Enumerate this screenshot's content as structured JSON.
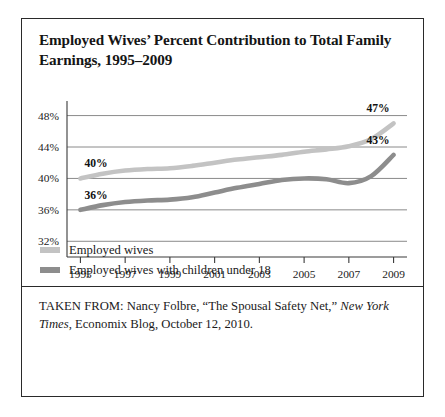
{
  "figure": {
    "title": "Employed Wives’ Percent Contribution to Total Family Earnings, 1995–2009",
    "source_prefix": "TAKEN FROM: Nancy Folbre, “The Spousal Safety Net,” ",
    "source_italic": "New York Times",
    "source_suffix": ", Economix Blog, October 12, 2010."
  },
  "colors": {
    "series_light": "#c3c3c3",
    "series_dark": "#8d8d8d",
    "axis": "#3a3a3a",
    "gridline": "#7d7d7d",
    "border": "#2a2a2a",
    "text": "#1a1a1a"
  },
  "chart_data": {
    "type": "line",
    "title": "Employed Wives’ Percent Contribution to Total Family Earnings, 1995–2009",
    "xlabel": "",
    "ylabel": "",
    "xlim": [
      1994.4,
      2009.6
    ],
    "ylim": [
      30.0,
      49.6
    ],
    "xticks": [
      1995,
      1996,
      1997,
      1998,
      1999,
      2000,
      2001,
      2002,
      2003,
      2004,
      2005,
      2006,
      2007,
      2008,
      2009
    ],
    "xtick_labels": [
      "1995",
      "",
      "1997",
      "",
      "1999",
      "",
      "2001",
      "",
      "2003",
      "",
      "2005",
      "",
      "2007",
      "",
      "2009"
    ],
    "yticks": [
      32,
      36,
      40,
      44,
      48
    ],
    "ytick_labels": [
      "32%",
      "36%",
      "40%",
      "44%",
      "48%"
    ],
    "grid": "horizontal",
    "legend_position": "below-plot",
    "x": [
      1995,
      1996,
      1997,
      1998,
      1999,
      2000,
      2001,
      2002,
      2003,
      2004,
      2005,
      2006,
      2007,
      2008,
      2009
    ],
    "series": [
      {
        "name": "Employed wives",
        "color": "#c3c3c3",
        "values": [
          40.0,
          40.6,
          41.0,
          41.2,
          41.3,
          41.6,
          42.0,
          42.4,
          42.7,
          43.0,
          43.4,
          43.7,
          44.1,
          45.0,
          47.0
        ],
        "start_label": "40%",
        "end_label": "47%"
      },
      {
        "name": "Employed wives with children under 18",
        "color": "#8d8d8d",
        "values": [
          36.0,
          36.6,
          37.0,
          37.2,
          37.3,
          37.6,
          38.2,
          38.8,
          39.3,
          39.8,
          40.0,
          39.9,
          39.4,
          40.3,
          43.0
        ],
        "start_label": "36%",
        "end_label": "43%"
      }
    ],
    "annotations": [
      {
        "text": "40%",
        "series": "Employed wives",
        "at_x": 1995,
        "position": "above-start"
      },
      {
        "text": "36%",
        "series": "Employed wives with children under 18",
        "at_x": 1995,
        "position": "above-start"
      },
      {
        "text": "47%",
        "series": "Employed wives",
        "at_x": 2009,
        "position": "above-end"
      },
      {
        "text": "43%",
        "series": "Employed wives with children under 18",
        "at_x": 2009,
        "position": "above-end"
      }
    ]
  },
  "legend": {
    "items": [
      {
        "label": "Employed wives",
        "color": "#c3c3c3"
      },
      {
        "label": "Employed wives with children under 18",
        "color": "#8d8d8d"
      }
    ]
  }
}
